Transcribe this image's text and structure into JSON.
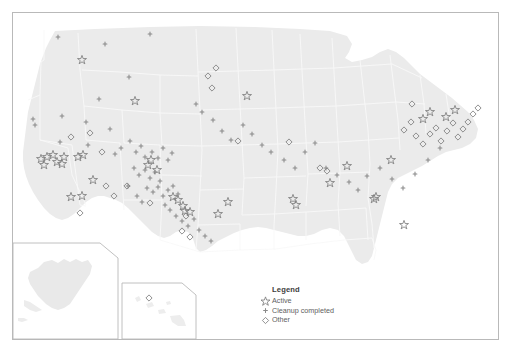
{
  "figure": {
    "background_color": "#ffffff",
    "frame_color": "#b9b9b9",
    "land_color": "#ebebeb",
    "state_border_color": "#f7f7f7",
    "marker_color": "#7d7d7d"
  },
  "legend": {
    "title": "Legend",
    "items": [
      {
        "icon": "star-outline-icon",
        "label": "Active",
        "symbol": "star"
      },
      {
        "icon": "cross-marker-icon",
        "label": "Cleanup completed",
        "symbol": "cross"
      },
      {
        "icon": "diamond-outline-icon",
        "label": "Other",
        "symbol": "diamond"
      }
    ]
  },
  "insets": [
    {
      "name": "alaska-inset",
      "label": ""
    },
    {
      "name": "hawaii-inset",
      "label": ""
    }
  ],
  "chart_data": {
    "type": "scatter",
    "xlabel": "",
    "ylabel": "",
    "projection": "albers-usa",
    "grid": false,
    "legend_position": "bottom-center",
    "series": [
      {
        "name": "Active",
        "symbol": "star",
        "color": "#7d7d7d",
        "count": 37,
        "points": [
          [
            82,
            60
          ],
          [
            135,
            101
          ],
          [
            247,
            96
          ],
          [
            41,
            159
          ],
          [
            47,
            157
          ],
          [
            53,
            155
          ],
          [
            57,
            162
          ],
          [
            64,
            157
          ],
          [
            78,
            157
          ],
          [
            83,
            155
          ],
          [
            44,
            165
          ],
          [
            62,
            164
          ],
          [
            71,
            197
          ],
          [
            82,
            196
          ],
          [
            93,
            180
          ],
          [
            148,
            165
          ],
          [
            151,
            160
          ],
          [
            157,
            170
          ],
          [
            173,
            197
          ],
          [
            178,
            200
          ],
          [
            183,
            206
          ],
          [
            185,
            211
          ],
          [
            190,
            212
          ],
          [
            218,
            214
          ],
          [
            228,
            202
          ],
          [
            293,
            199
          ],
          [
            296,
            205
          ],
          [
            330,
            183
          ],
          [
            347,
            166
          ],
          [
            376,
            197
          ],
          [
            374,
            199
          ],
          [
            404,
            225
          ],
          [
            391,
            160
          ],
          [
            423,
            119
          ],
          [
            430,
            112
          ],
          [
            446,
            117
          ],
          [
            455,
            110
          ]
        ]
      },
      {
        "name": "Cleanup completed",
        "symbol": "cross",
        "color": "#8a8a8a",
        "count": 72,
        "points": [
          [
            58,
            37
          ],
          [
            105,
            44
          ],
          [
            150,
            34
          ],
          [
            129,
            77
          ],
          [
            99,
            99
          ],
          [
            33,
            119
          ],
          [
            35,
            125
          ],
          [
            62,
            116
          ],
          [
            86,
            122
          ],
          [
            110,
            129
          ],
          [
            60,
            142
          ],
          [
            88,
            145
          ],
          [
            115,
            154
          ],
          [
            121,
            148
          ],
          [
            130,
            141
          ],
          [
            136,
            152
          ],
          [
            141,
            146
          ],
          [
            145,
            157
          ],
          [
            152,
            152
          ],
          [
            158,
            158
          ],
          [
            163,
            148
          ],
          [
            168,
            160
          ],
          [
            172,
            153
          ],
          [
            134,
            168
          ],
          [
            139,
            175
          ],
          [
            145,
            170
          ],
          [
            150,
            178
          ],
          [
            155,
            172
          ],
          [
            160,
            181
          ],
          [
            147,
            188
          ],
          [
            153,
            192
          ],
          [
            158,
            187
          ],
          [
            163,
            196
          ],
          [
            168,
            190
          ],
          [
            173,
            186
          ],
          [
            178,
            194
          ],
          [
            165,
            205
          ],
          [
            170,
            210
          ],
          [
            176,
            216
          ],
          [
            182,
            221
          ],
          [
            188,
            226
          ],
          [
            194,
            219
          ],
          [
            199,
            230
          ],
          [
            205,
            236
          ],
          [
            211,
            241
          ],
          [
            137,
            196
          ],
          [
            142,
            202
          ],
          [
            128,
            186
          ],
          [
            196,
            104
          ],
          [
            202,
            112
          ],
          [
            213,
            120
          ],
          [
            222,
            131
          ],
          [
            231,
            140
          ],
          [
            243,
            125
          ],
          [
            252,
            134
          ],
          [
            262,
            145
          ],
          [
            271,
            152
          ],
          [
            284,
            160
          ],
          [
            295,
            168
          ],
          [
            305,
            152
          ],
          [
            315,
            143
          ],
          [
            326,
            168
          ],
          [
            337,
            175
          ],
          [
            349,
            182
          ],
          [
            358,
            190
          ],
          [
            367,
            176
          ],
          [
            380,
            168
          ],
          [
            392,
            179
          ],
          [
            403,
            188
          ],
          [
            415,
            174
          ],
          [
            428,
            160
          ],
          [
            440,
            148
          ]
        ]
      },
      {
        "name": "Other",
        "symbol": "diamond",
        "color": "#7d7d7d",
        "count": 34,
        "points": [
          [
            71,
            137
          ],
          [
            102,
            152
          ],
          [
            90,
            133
          ],
          [
            106,
            186
          ],
          [
            80,
            213
          ],
          [
            127,
            186
          ],
          [
            114,
            196
          ],
          [
            150,
            203
          ],
          [
            182,
            231
          ],
          [
            186,
            216
          ],
          [
            190,
            237
          ],
          [
            208,
            76
          ],
          [
            216,
            68
          ],
          [
            212,
            88
          ],
          [
            238,
            141
          ],
          [
            289,
            142
          ],
          [
            320,
            168
          ],
          [
            327,
            171
          ],
          [
            404,
            130
          ],
          [
            411,
            122
          ],
          [
            416,
            136
          ],
          [
            423,
            144
          ],
          [
            430,
            134
          ],
          [
            436,
            128
          ],
          [
            441,
            141
          ],
          [
            447,
            131
          ],
          [
            453,
            123
          ],
          [
            458,
            137
          ],
          [
            463,
            129
          ],
          [
            468,
            122
          ],
          [
            473,
            114
          ],
          [
            478,
            108
          ],
          [
            412,
            104
          ],
          [
            149,
            298
          ]
        ]
      }
    ]
  }
}
